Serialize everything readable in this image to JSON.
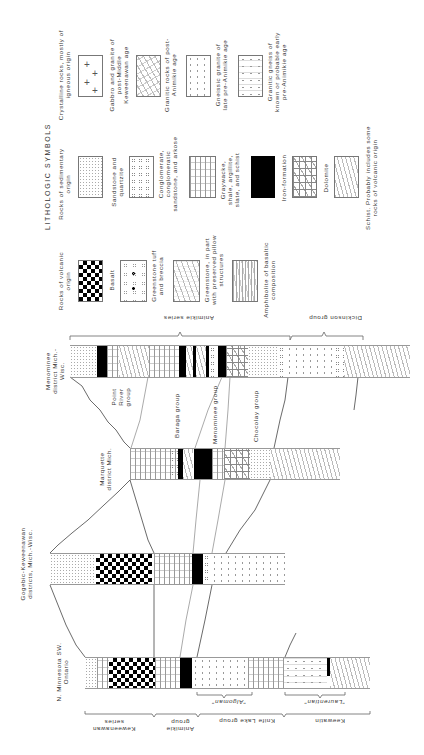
{
  "legend": {
    "title": "LITHOLOGIC SYMBOLS",
    "groups": [
      {
        "heading": "Crystalline rocks, mostly of igneous origin",
        "items": [
          {
            "pattern": "plus-crosses",
            "label": "Gabbro and granite of post-Middle Keweenawan age"
          },
          {
            "pattern": "granite-random-dash",
            "label": "Granitic rocks of post-Animikie age"
          },
          {
            "pattern": "gneissic-granite-dots",
            "label": "Gneissic granite of late pre-Animikie age"
          },
          {
            "pattern": "granitic-gneiss",
            "label": "Granitic gneiss of known or probable early pre-Animikie age"
          }
        ]
      },
      {
        "heading": "Rocks of sedimentary origin",
        "items": [
          {
            "pattern": "stipple",
            "label": "Sandstone and quartzite"
          },
          {
            "pattern": "small-circles",
            "label": "Conglomerate, conglomeratic sandstone, and arkose"
          },
          {
            "pattern": "dashed-lines",
            "label": "Graywacke, shale, argillite, slate, and schist"
          },
          {
            "pattern": "solid-black",
            "label": "Iron-formation"
          },
          {
            "pattern": "brick-diagonal",
            "label": "Dolomite"
          },
          {
            "pattern": "wavy-foliation",
            "label": "Schist. Probably includes some rocks of volcanic origin"
          }
        ]
      },
      {
        "heading": "Rocks of volcanic origin",
        "items": [
          {
            "pattern": "checker-black",
            "label": "Basalt"
          },
          {
            "pattern": "circles-and-blots",
            "label": "Greenstone tuff and breccia"
          },
          {
            "pattern": "short-dashes",
            "label": "Greenstone, in part with preserved pillow structures"
          },
          {
            "pattern": "fine-lineation",
            "label": "Amphibolite of basaltic composition"
          }
        ]
      }
    ]
  },
  "columns": [
    {
      "id": "menominee",
      "label": "Menominee district Mich.-Wisc."
    },
    {
      "id": "marquette",
      "label": "Marquette district Mich."
    },
    {
      "id": "gogebic",
      "label": "Gogebic-Keweenawan districts, Mich.-Wisc."
    },
    {
      "id": "minnesota",
      "label": "N. Minnesota SW. Ontario"
    }
  ],
  "group_labels": {
    "point_river": "Point River group",
    "baraga": "Baraga group",
    "menominee_group": "Menominee group",
    "chocolay": "Chocolay group"
  },
  "upper_brackets": {
    "animikie_series": "Animikie series",
    "dickinson_group": "Dickinson group"
  },
  "lower_brackets": {
    "algoman": "\"Algoman\"",
    "laurentian": "\"Laurentian\"",
    "keweenawan_series": "Keweenawan series",
    "animikie_group": "Animikie group",
    "knife_lake_group": "Knife Lake group",
    "keewatin": "Keewatin"
  }
}
